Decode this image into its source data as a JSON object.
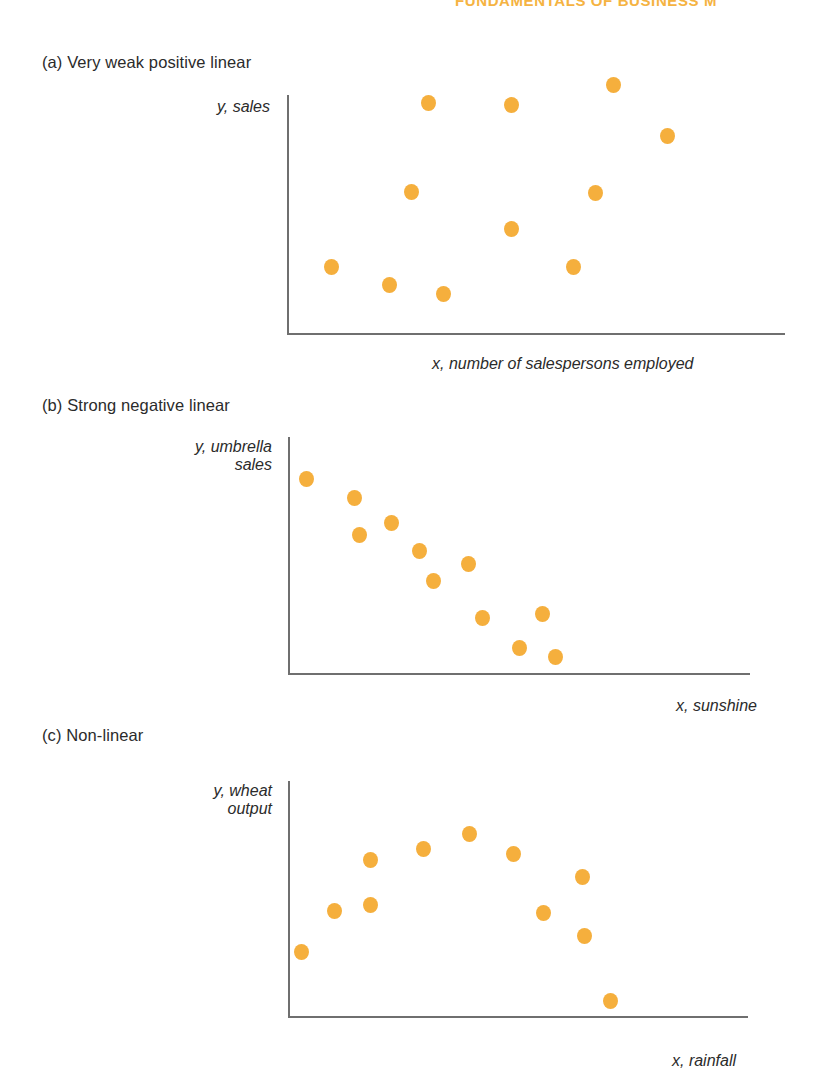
{
  "running_header": {
    "text": "FUNDAMENTALS OF BUSINESS M"
  },
  "dot_color": "#f5af3d",
  "axis_color": "#6f6f6f",
  "panels": [
    {
      "id": "a",
      "title": "(a) Very weak positive linear",
      "y_label": "y, sales",
      "x_label": "x, number of salespersons employed"
    },
    {
      "id": "b",
      "title": "(b) Strong negative linear",
      "y_label": "y, umbrella\nsales",
      "x_label": "x, sunshine"
    },
    {
      "id": "c",
      "title": "(c) Non-linear",
      "y_label": "y, wheat\noutput",
      "x_label": "x, rainfall"
    }
  ],
  "chart_data": [
    {
      "type": "scatter",
      "title": "(a) Very weak positive linear",
      "xlabel": "x, number of salespersons employed",
      "ylabel": "y, sales",
      "grid": false,
      "legend": "none",
      "xlim": [
        0,
        100
      ],
      "ylim": [
        0,
        100
      ],
      "points": [
        {
          "x": 9.0,
          "y": 28.5
        },
        {
          "x": 20.5,
          "y": 21.0
        },
        {
          "x": 31.5,
          "y": 17.0
        },
        {
          "x": 25.0,
          "y": 59.5
        },
        {
          "x": 28.5,
          "y": 96.5
        },
        {
          "x": 45.0,
          "y": 44.0
        },
        {
          "x": 45.0,
          "y": 96.0
        },
        {
          "x": 57.5,
          "y": 28.5
        },
        {
          "x": 62.0,
          "y": 59.0
        },
        {
          "x": 65.5,
          "y": 104.0
        },
        {
          "x": 76.5,
          "y": 83.0
        }
      ]
    },
    {
      "type": "scatter",
      "title": "(b) Strong negative linear",
      "xlabel": "x, sunshine",
      "ylabel": "y, umbrella sales",
      "grid": false,
      "legend": "none",
      "xlim": [
        0,
        100
      ],
      "ylim": [
        0,
        100
      ],
      "points": [
        {
          "x": 4.0,
          "y": 82.5
        },
        {
          "x": 14.5,
          "y": 74.5
        },
        {
          "x": 15.5,
          "y": 59.0
        },
        {
          "x": 22.5,
          "y": 64.0
        },
        {
          "x": 28.5,
          "y": 52.0
        },
        {
          "x": 31.5,
          "y": 39.5
        },
        {
          "x": 39.0,
          "y": 46.5
        },
        {
          "x": 42.0,
          "y": 24.0
        },
        {
          "x": 50.0,
          "y": 11.5
        },
        {
          "x": 55.0,
          "y": 25.5
        },
        {
          "x": 58.0,
          "y": 7.5
        }
      ]
    },
    {
      "type": "scatter",
      "title": "(c) Non-linear",
      "xlabel": "x, rainfall",
      "ylabel": "y, wheat output",
      "grid": false,
      "legend": "none",
      "xlim": [
        0,
        100
      ],
      "ylim": [
        0,
        100
      ],
      "points": [
        {
          "x": 3.0,
          "y": 28.0
        },
        {
          "x": 10.0,
          "y": 45.0
        },
        {
          "x": 18.0,
          "y": 66.5
        },
        {
          "x": 18.0,
          "y": 47.5
        },
        {
          "x": 29.5,
          "y": 71.5
        },
        {
          "x": 39.5,
          "y": 77.5
        },
        {
          "x": 49.0,
          "y": 69.0
        },
        {
          "x": 55.5,
          "y": 44.5
        },
        {
          "x": 64.0,
          "y": 59.5
        },
        {
          "x": 64.5,
          "y": 34.5
        },
        {
          "x": 70.0,
          "y": 7.0
        }
      ]
    }
  ]
}
